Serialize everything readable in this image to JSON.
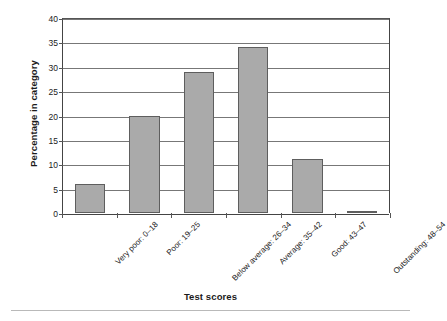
{
  "chart_data": {
    "type": "bar",
    "title": "",
    "xlabel": "Test scores",
    "ylabel": "Percentage in category",
    "categories": [
      "Very poor: 0–18",
      "Poor: 19–25",
      "Below average: 26–34",
      "Average: 35–42",
      "Good: 43–47",
      "Outstanding: 48–54"
    ],
    "values": [
      6,
      20,
      29,
      34,
      11,
      0
    ],
    "ylim": [
      0,
      40
    ],
    "yticks": [
      0,
      5,
      10,
      15,
      20,
      25,
      30,
      35,
      40
    ],
    "ytick_labels": [
      "0",
      "5",
      "10",
      "15",
      "20",
      "25",
      "30",
      "35",
      "40"
    ],
    "grid": true,
    "legend": false,
    "bar_color": "#aaaaaa",
    "bar_edge_color": "#5e5e5e",
    "axis_color": "#444444",
    "gridline_color": "#777777",
    "background_color": "#ffffff"
  }
}
